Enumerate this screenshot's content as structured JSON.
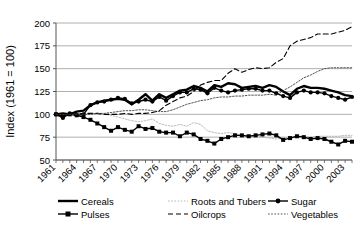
{
  "chart_data": {
    "type": "line",
    "title": "",
    "xlabel": "",
    "ylabel": "Index (1961 = 100)",
    "ylim": [
      50,
      200
    ],
    "yticks": [
      50,
      75,
      100,
      125,
      150,
      175,
      200
    ],
    "xlim": [
      1961,
      2004
    ],
    "xticks_labeled": [
      1961,
      1964,
      1967,
      1970,
      1973,
      1976,
      1979,
      1982,
      1985,
      1988,
      1991,
      1994,
      1997,
      2000,
      2003
    ],
    "grid": "horizontal",
    "legend_position": "bottom",
    "x": [
      1961,
      1962,
      1963,
      1964,
      1965,
      1966,
      1967,
      1968,
      1969,
      1970,
      1971,
      1972,
      1973,
      1974,
      1975,
      1976,
      1977,
      1978,
      1979,
      1980,
      1981,
      1982,
      1983,
      1984,
      1985,
      1986,
      1987,
      1988,
      1989,
      1990,
      1991,
      1992,
      1993,
      1994,
      1995,
      1996,
      1997,
      1998,
      1999,
      2000,
      2001,
      2002,
      2003,
      2004
    ],
    "series": [
      {
        "name": "Cereals",
        "style": "solid-thick",
        "color": "#000000",
        "marker": "none",
        "values": [
          100,
          101,
          100,
          103,
          104,
          110,
          113,
          115,
          116,
          117,
          116,
          111,
          116,
          122,
          115,
          122,
          118,
          122,
          126,
          127,
          131,
          129,
          125,
          132,
          130,
          134,
          133,
          129,
          130,
          131,
          129,
          132,
          130,
          125,
          121,
          128,
          131,
          129,
          129,
          128,
          126,
          124,
          121,
          120
        ]
      },
      {
        "name": "Roots and Tubers",
        "style": "dotted-light",
        "color": "#b0b0b0",
        "marker": "none",
        "values": [
          100,
          99,
          100,
          100,
          100,
          101,
          101,
          100,
          99,
          97,
          95,
          93,
          92,
          93,
          95,
          90,
          88,
          87,
          89,
          87,
          91,
          89,
          82,
          80,
          79,
          80,
          79,
          77,
          77,
          76,
          75,
          74,
          73,
          74,
          74,
          76,
          76,
          75,
          76,
          76,
          76,
          76,
          77,
          77
        ]
      },
      {
        "name": "Sugar",
        "style": "solid-marker",
        "color": "#000000",
        "marker": "circle",
        "values": [
          100,
          96,
          101,
          99,
          100,
          110,
          113,
          114,
          116,
          118,
          117,
          112,
          114,
          116,
          114,
          119,
          115,
          120,
          124,
          124,
          128,
          127,
          123,
          129,
          126,
          124,
          126,
          127,
          128,
          128,
          126,
          126,
          123,
          120,
          118,
          124,
          126,
          124,
          124,
          123,
          120,
          118,
          116,
          119
        ]
      },
      {
        "name": "Pulses",
        "style": "solid-marker",
        "color": "#000000",
        "marker": "square",
        "values": [
          100,
          98,
          100,
          99,
          97,
          94,
          90,
          86,
          82,
          86,
          83,
          81,
          87,
          84,
          85,
          81,
          80,
          80,
          76,
          80,
          78,
          73,
          71,
          68,
          73,
          75,
          77,
          77,
          76,
          77,
          78,
          79,
          77,
          72,
          74,
          76,
          75,
          73,
          74,
          73,
          70,
          67,
          71,
          70
        ]
      },
      {
        "name": "Oilcrops",
        "style": "dashed",
        "color": "#000000",
        "marker": "none",
        "values": [
          100,
          100,
          100,
          100,
          101,
          101,
          101,
          100,
          100,
          100,
          101,
          100,
          101,
          101,
          102,
          104,
          110,
          114,
          118,
          120,
          125,
          132,
          135,
          137,
          137,
          145,
          150,
          146,
          149,
          151,
          150,
          151,
          157,
          161,
          175,
          180,
          182,
          184,
          188,
          188,
          188,
          190,
          192,
          196
        ]
      },
      {
        "name": "Vegetables",
        "style": "dotted",
        "color": "#404040",
        "marker": "none",
        "values": [
          100,
          100,
          100,
          100,
          100,
          100,
          101,
          101,
          102,
          103,
          104,
          104,
          105,
          105,
          104,
          103,
          103,
          105,
          108,
          111,
          113,
          115,
          116,
          118,
          119,
          119,
          120,
          120,
          121,
          121,
          121,
          122,
          121,
          126,
          130,
          135,
          140,
          143,
          147,
          150,
          151,
          151,
          151,
          151
        ]
      }
    ]
  },
  "legend": {
    "entries": [
      {
        "label": "Cereals"
      },
      {
        "label": "Roots and Tubers"
      },
      {
        "label": "Sugar"
      },
      {
        "label": "Pulses"
      },
      {
        "label": "Oilcrops"
      },
      {
        "label": "Vegetables"
      }
    ]
  }
}
